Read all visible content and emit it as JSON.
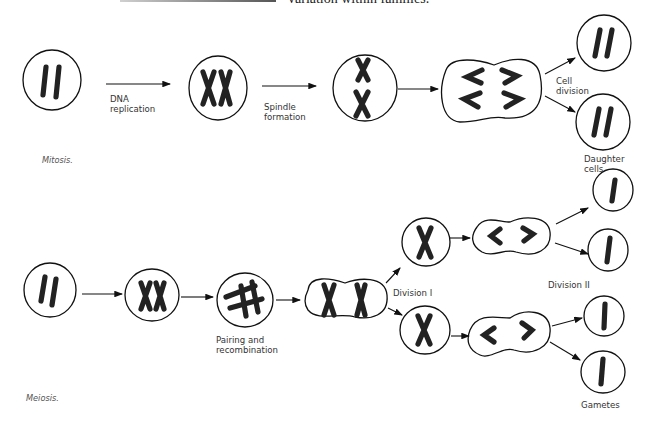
{
  "header": {
    "text_fragment": "variation within families."
  },
  "mitosis": {
    "caption": "Mitosis.",
    "labels": {
      "dna_replication": "DNA\nreplication",
      "spindle_formation": "Spindle\nformation",
      "cell_division": "Cell\ndivision",
      "daughter_cells": "Daughter\ncells"
    },
    "stages": [
      "Parent cell (2 chromosomes)",
      "Replicated chromosomes",
      "Spindle / metaphase",
      "Anaphase",
      "Daughter cell 1",
      "Daughter cell 2"
    ]
  },
  "meiosis": {
    "caption": "Meiosis.",
    "labels": {
      "pairing": "Pairing and\nrecombination",
      "division_1": "Division I",
      "division_2": "Division II",
      "gametes": "Gametes"
    },
    "stages": [
      "Parent cell",
      "Replicated chromosomes",
      "Pairing and recombination",
      "Division I cell",
      "Secondary cell A",
      "Secondary cell B",
      "Division II cell A",
      "Division II cell B",
      "Gamete 1",
      "Gamete 2",
      "Gamete 3",
      "Gamete 4"
    ]
  }
}
